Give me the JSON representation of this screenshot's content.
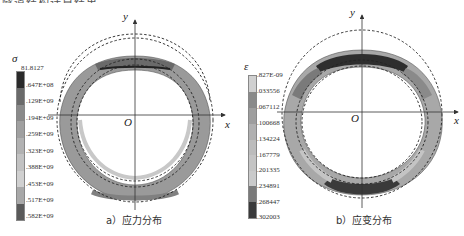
{
  "header": {
    "cutoff_text": "隧道结构计算结果"
  },
  "panels": [
    {
      "id": "a",
      "caption": "a）应力分布",
      "axis": {
        "x": "x",
        "y": "y",
        "origin": "O"
      },
      "legend": {
        "symbol": "σ",
        "labels": [
          "81.8127",
          ".647E+08",
          ".129E+09",
          ".194E+09",
          ".259E+09",
          ".323E+09",
          ".388E+09",
          ".453E+09",
          ".517E+09",
          ".582E+09"
        ],
        "colors": [
          "#2a2a2a",
          "#5a5a5a",
          "#7a7a7a",
          "#909090",
          "#a4a4a4",
          "#b4b4b4",
          "#c4c4c4",
          "#d2d2d2",
          "#5c5c5c"
        ]
      }
    },
    {
      "id": "b",
      "caption": "b）应变分布",
      "axis": {
        "x": "x",
        "y": "y",
        "origin": "O"
      },
      "legend": {
        "symbol": "ε",
        "labels": [
          ".827E-09",
          ".033556",
          ".067112",
          ".100668",
          ".134224",
          ".167779",
          ".201335",
          ".234891",
          ".268447",
          ".302003"
        ],
        "colors": [
          "#d0d0d0",
          "#8a8a8a",
          "#a0a0a0",
          "#b0b0b0",
          "#bcbcbc",
          "#c4c4c4",
          "#cacaca",
          "#7a7a7a",
          "#3a3a3a"
        ]
      }
    }
  ]
}
